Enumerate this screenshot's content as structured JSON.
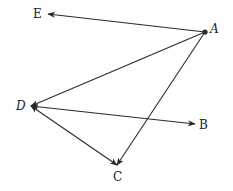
{
  "diagram": {
    "type": "directed-graph",
    "nodes": [
      {
        "id": "A",
        "label": "A",
        "x": 205,
        "y": 32,
        "lx": 210,
        "ly": 33,
        "italic": true,
        "dot": true
      },
      {
        "id": "B",
        "label": "B",
        "x": 195,
        "y": 124,
        "lx": 199,
        "ly": 129,
        "italic": false,
        "dot": false
      },
      {
        "id": "C",
        "label": "C",
        "x": 117,
        "y": 165,
        "lx": 113,
        "ly": 181,
        "italic": false,
        "dot": false
      },
      {
        "id": "D",
        "label": "D",
        "x": 31,
        "y": 106,
        "lx": 16,
        "ly": 110,
        "italic": true,
        "dot": false
      },
      {
        "id": "E",
        "label": "E",
        "x": 48,
        "y": 14,
        "lx": 33,
        "ly": 18,
        "italic": false,
        "dot": false
      }
    ],
    "edges": [
      {
        "from": "A",
        "to": "E",
        "arrow_end": true,
        "arrow_start": false
      },
      {
        "from": "A",
        "to": "D",
        "arrow_end": true,
        "arrow_start": false
      },
      {
        "from": "A",
        "to": "C",
        "arrow_end": true,
        "arrow_start": false
      },
      {
        "from": "D",
        "to": "B",
        "arrow_end": true,
        "arrow_start": true
      },
      {
        "from": "D",
        "to": "C",
        "arrow_end": true,
        "arrow_start": true
      }
    ],
    "colors": {
      "line": "#2a2a2a",
      "text": "#222222",
      "background": "#ffffff"
    }
  }
}
